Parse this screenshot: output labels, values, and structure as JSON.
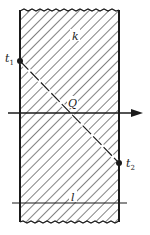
{
  "diagram": {
    "labels": {
      "k": "k",
      "t1_main": "t",
      "t1_sub": "1",
      "t2_main": "t",
      "t2_sub": "2",
      "Q": "Q",
      "l": "l"
    },
    "colors": {
      "ink": "#1a1a1a",
      "background": "#ffffff"
    }
  }
}
